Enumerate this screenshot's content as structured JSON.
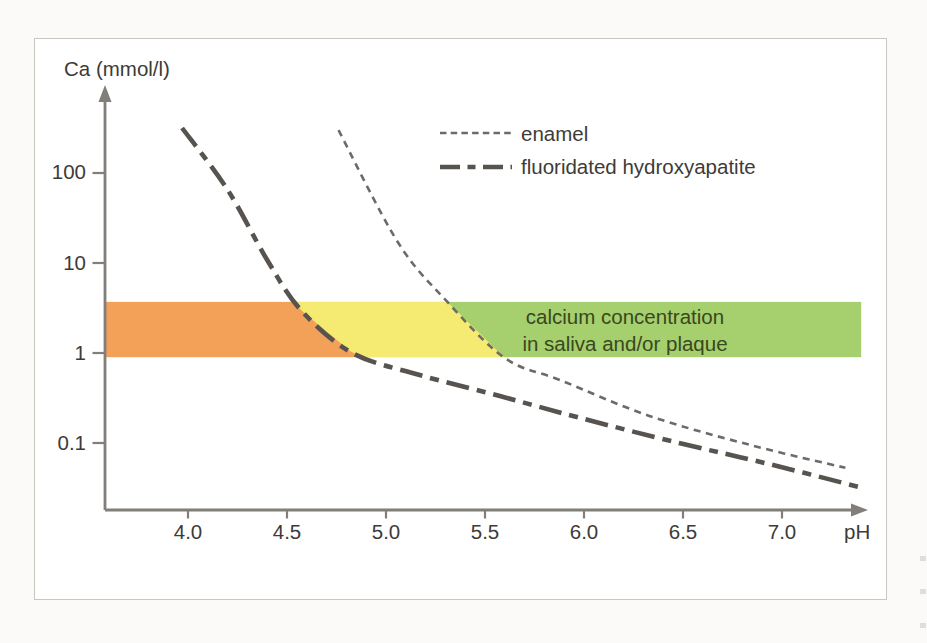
{
  "figure": {
    "panel_background": "#ffffff",
    "page_background": "#fbfaf8",
    "axis_color": "#827e79",
    "text_color": "#3e3b37"
  },
  "chart_data": {
    "type": "line",
    "title": "",
    "xlabel": "pH",
    "ylabel": "Ca (mmol/l)",
    "x_scale": "linear",
    "y_scale": "log10",
    "xlim": [
      3.58,
      7.42
    ],
    "ylim": [
      0.025,
      400
    ],
    "x_ticks": [
      "4.0",
      "4.5",
      "5.0",
      "5.5",
      "6.0",
      "6.5",
      "7.0"
    ],
    "y_ticks": [
      "100",
      "10",
      "1",
      "0.1"
    ],
    "grid": false,
    "legend_position": "inside-top-center",
    "series": [
      {
        "name": "enamel",
        "line_style": "dashed",
        "stroke_width": "thin",
        "color": "#6e6a66",
        "points": [
          [
            4.76,
            300
          ],
          [
            5.06,
            17
          ],
          [
            5.31,
            3.7
          ],
          [
            5.6,
            0.88
          ],
          [
            5.88,
            0.5
          ],
          [
            6.33,
            0.2
          ],
          [
            6.84,
            0.095
          ],
          [
            7.32,
            0.053
          ]
        ]
      },
      {
        "name": "fluoridated hydroxyapatite",
        "line_style": "dash-dot",
        "stroke_width": "thick",
        "color": "#57534f",
        "points": [
          [
            3.97,
            316
          ],
          [
            4.2,
            65
          ],
          [
            4.4,
            10.8
          ],
          [
            4.57,
            3.0
          ],
          [
            4.83,
            1.0
          ],
          [
            5.17,
            0.57
          ],
          [
            5.58,
            0.33
          ],
          [
            5.98,
            0.19
          ],
          [
            6.48,
            0.1
          ],
          [
            6.94,
            0.058
          ],
          [
            7.4,
            0.032
          ]
        ]
      }
    ],
    "band": {
      "label": "calcium concentration in saliva and/or plaque",
      "label_line1": "calcium concentration",
      "label_line2": "in saliva and/or plaque",
      "ca_range": [
        0.9,
        3.7
      ],
      "ph_range": [
        3.58,
        7.4
      ],
      "segment_colors": {
        "left_of_fluorapatite_curve": "#f3a159",
        "between_curves": "#f5eb72",
        "right_of_enamel_curve": "#a6cf6e"
      },
      "text_color": "#39481d"
    }
  }
}
